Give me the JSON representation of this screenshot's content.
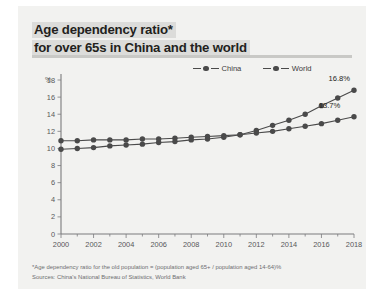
{
  "title": {
    "line1": "Age dependency ratio*",
    "line2": "for over 65s in China and the world"
  },
  "unit_label": "%",
  "legend": [
    {
      "label": "China",
      "color": "#4a4a4a",
      "marker": "line-dot-marker"
    },
    {
      "label": "World",
      "color": "#4a4a4a",
      "marker": "line-dot-marker"
    }
  ],
  "footnotes": {
    "definition": "*Age dependency ratio for the old population = (population aged 65+ / population aged 14-64)%",
    "sources": "Sources: China's National Bureau of Statistics, World Bank"
  },
  "chart_data": {
    "type": "line",
    "title": "Age dependency ratio* for over 65s in China and the world",
    "xlabel": "",
    "ylabel": "%",
    "ylim": [
      0,
      18
    ],
    "yticks": [
      0,
      2,
      4,
      6,
      8,
      10,
      12,
      14,
      16,
      18
    ],
    "xlim": [
      2000,
      2018
    ],
    "xticks": [
      2000,
      2002,
      2004,
      2006,
      2008,
      2010,
      2012,
      2014,
      2016,
      2018
    ],
    "x": [
      2000,
      2001,
      2002,
      2003,
      2004,
      2005,
      2006,
      2007,
      2008,
      2009,
      2010,
      2011,
      2012,
      2013,
      2014,
      2015,
      2016,
      2017,
      2018
    ],
    "grid": false,
    "legend_position": "top-right",
    "series": [
      {
        "name": "China",
        "color": "#4a4a4a",
        "values": [
          9.9,
          10.0,
          10.1,
          10.3,
          10.4,
          10.5,
          10.7,
          10.8,
          11.0,
          11.1,
          11.3,
          11.6,
          12.1,
          12.7,
          13.3,
          14.0,
          15.0,
          15.9,
          16.8
        ],
        "end_label": "16.8%"
      },
      {
        "name": "World",
        "color": "#4a4a4a",
        "values": [
          10.9,
          10.9,
          11.0,
          11.0,
          11.0,
          11.1,
          11.1,
          11.2,
          11.3,
          11.4,
          11.5,
          11.6,
          11.8,
          12.0,
          12.3,
          12.6,
          12.9,
          13.3,
          13.7
        ],
        "end_label": "13.7%"
      }
    ]
  }
}
